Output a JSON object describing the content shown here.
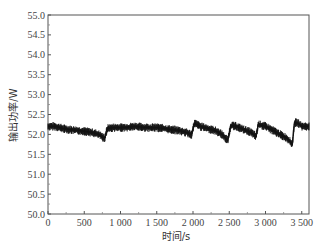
{
  "chart_data": {
    "type": "line",
    "title": "",
    "xlabel": "时间/s",
    "ylabel": "输出功率/W",
    "xlim": [
      0,
      3600
    ],
    "ylim": [
      50.0,
      55.0
    ],
    "xticks": [
      0,
      500,
      1000,
      1500,
      2000,
      2500,
      3000,
      3500
    ],
    "xtick_labels": [
      "0",
      "500",
      "1 000",
      "1 500",
      "2 000",
      "2 500",
      "3 000",
      "3 500"
    ],
    "yticks": [
      50.0,
      50.5,
      51.0,
      51.5,
      52.0,
      52.5,
      53.0,
      53.5,
      54.0,
      54.5,
      55.0
    ],
    "ytick_labels": [
      "50.0",
      "50.5",
      "51.0",
      "51.5",
      "52.0",
      "52.5",
      "53.0",
      "53.5",
      "54.0",
      "54.5",
      "55.0"
    ],
    "grid": false,
    "legend": null,
    "series": [
      {
        "name": "输出功率",
        "color": "#111111",
        "x": [
          0,
          100,
          200,
          300,
          400,
          500,
          600,
          700,
          780,
          820,
          900,
          1000,
          1100,
          1200,
          1300,
          1400,
          1500,
          1600,
          1700,
          1800,
          1900,
          1980,
          2020,
          2100,
          2200,
          2300,
          2400,
          2480,
          2520,
          2600,
          2700,
          2800,
          2870,
          2900,
          3000,
          3100,
          3200,
          3300,
          3370,
          3400,
          3450,
          3500,
          3600
        ],
        "y": [
          52.2,
          52.2,
          52.15,
          52.12,
          52.1,
          52.08,
          52.05,
          52.0,
          51.9,
          52.15,
          52.17,
          52.17,
          52.18,
          52.2,
          52.18,
          52.17,
          52.17,
          52.15,
          52.12,
          52.1,
          52.05,
          52.0,
          52.28,
          52.2,
          52.15,
          52.1,
          52.0,
          51.85,
          52.22,
          52.2,
          52.12,
          52.05,
          51.95,
          52.25,
          52.2,
          52.1,
          52.0,
          51.9,
          51.75,
          52.3,
          52.28,
          52.2,
          52.2
        ]
      }
    ]
  }
}
